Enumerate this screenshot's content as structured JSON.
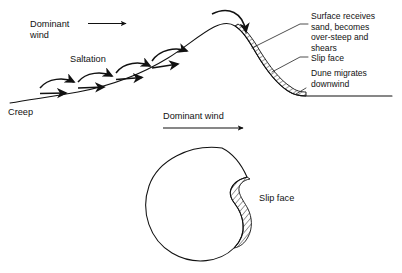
{
  "figure": {
    "background_color": "#ffffff",
    "ink_color": "#111111"
  },
  "upper_panel": {
    "name": "dune-cross-section",
    "labels": {
      "dominant_wind": "Dominant",
      "dominant_wind_line2": "wind",
      "saltation": "Saltation",
      "creep": "Creep"
    },
    "annotations": [
      {
        "id": "surface-receives",
        "lines": [
          "Surface receives",
          "sand, becomes",
          "over-steep and",
          "shears"
        ]
      },
      {
        "id": "slip-face",
        "lines": [
          "Slip face"
        ]
      },
      {
        "id": "dune-migrates",
        "lines": [
          "Dune migrates",
          "downwind"
        ]
      }
    ],
    "saltation_hop_count": 4
  },
  "middle_panel": {
    "name": "dominant-wind-plan-view",
    "label": "Dominant wind"
  },
  "lower_panel": {
    "name": "barchan-plan-view",
    "label": "Slip face"
  }
}
